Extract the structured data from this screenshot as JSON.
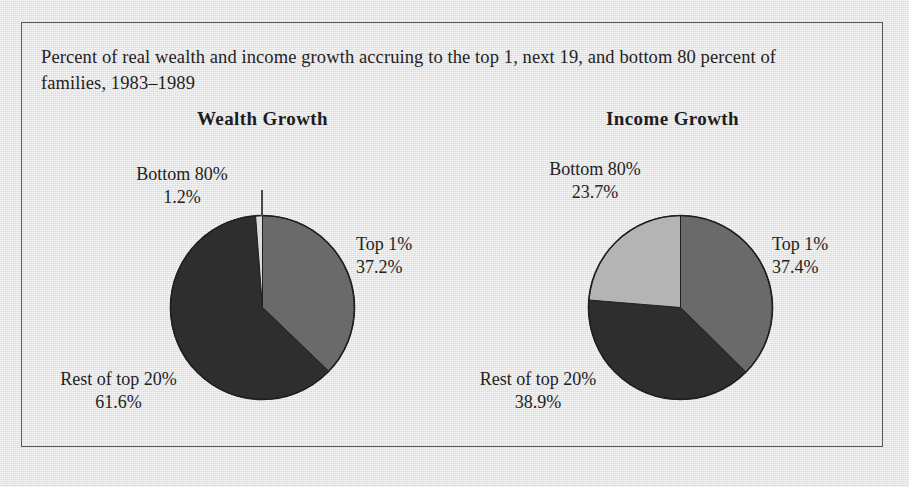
{
  "figure": {
    "caption": "Percent of real wealth and income growth accruing to the top 1, next 19, and bottom 80 percent of families, 1983–1989",
    "background_color": "#e4e4e4",
    "frame_color": "#5a5a5a"
  },
  "charts": {
    "wealth": {
      "title": "Wealth Growth",
      "labels": {
        "bottom": {
          "name": "Bottom 80%",
          "pct": "1.2%"
        },
        "top1": {
          "name": "Top 1%",
          "pct": "37.2%"
        },
        "rest": {
          "name": "Rest of top 20%",
          "pct": "61.6%"
        }
      }
    },
    "income": {
      "title": "Income Growth",
      "labels": {
        "bottom": {
          "name": "Bottom 80%",
          "pct": "23.7%"
        },
        "top1": {
          "name": "Top 1%",
          "pct": "37.4%"
        },
        "rest": {
          "name": "Rest of top 20%",
          "pct": "38.9%"
        }
      }
    }
  },
  "chart_data": [
    {
      "type": "pie",
      "title": "Wealth Growth",
      "categories": [
        "Top 1%",
        "Rest of top 20%",
        "Bottom 80%"
      ],
      "values": [
        37.2,
        61.6,
        1.2
      ],
      "units": "percent",
      "colors": [
        "#6a6a6a",
        "#2e2e2e",
        "#dcdcdc"
      ],
      "start_angle_deg": 0,
      "direction": "clockwise",
      "legend": "none",
      "data_labels": [
        "Top 1% 37.2%",
        "Rest of top 20% 61.6%",
        "Bottom 80% 1.2%"
      ]
    },
    {
      "type": "pie",
      "title": "Income Growth",
      "categories": [
        "Top 1%",
        "Rest of top 20%",
        "Bottom 80%"
      ],
      "values": [
        37.4,
        38.9,
        23.7
      ],
      "units": "percent",
      "colors": [
        "#6a6a6a",
        "#2e2e2e",
        "#b4b4b4"
      ],
      "start_angle_deg": 0,
      "direction": "clockwise",
      "legend": "none",
      "data_labels": [
        "Top 1% 37.4%",
        "Rest of top 20% 38.9%",
        "Bottom 80% 23.7%"
      ]
    }
  ]
}
